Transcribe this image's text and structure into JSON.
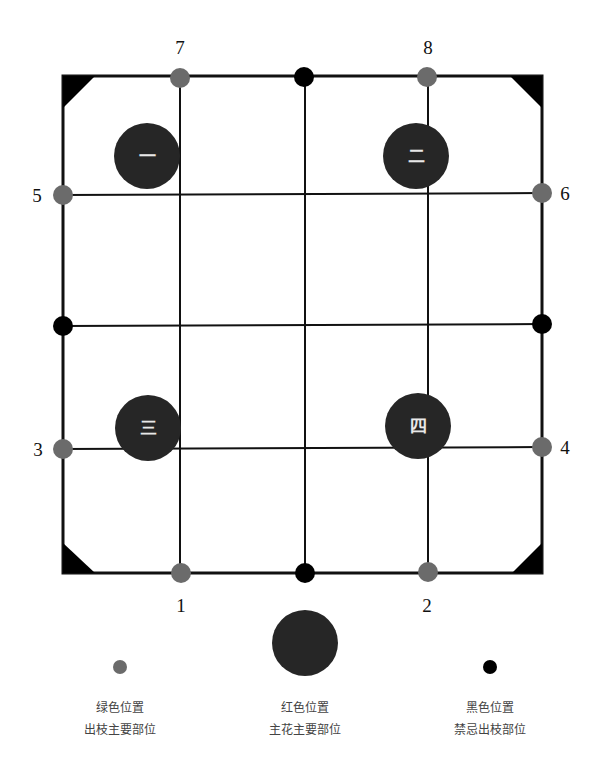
{
  "diagram": {
    "colors": {
      "frame": "#111111",
      "green_dot": "#6b6b6b",
      "red_circle": "#262626",
      "black_dot": "#000000",
      "glyph": "#e8e8e8"
    },
    "position_numbers": {
      "p1": "1",
      "p2": "2",
      "p3": "3",
      "p4": "4",
      "p5": "5",
      "p6": "6",
      "p7": "7",
      "p8": "8"
    },
    "main_positions": {
      "m1": "一",
      "m2": "二",
      "m3": "三",
      "m4": "四"
    }
  },
  "legend": {
    "green": {
      "line1": "绿色位置",
      "line2": "出枝主要部位"
    },
    "red": {
      "line1": "红色位置",
      "line2": "主花主要部位"
    },
    "black": {
      "line1": "黑色位置",
      "line2": "禁忌出枝部位"
    }
  }
}
